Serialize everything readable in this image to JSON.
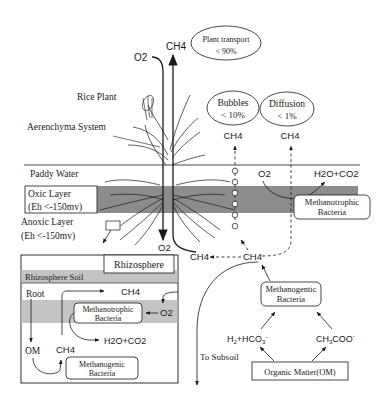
{
  "labels": {
    "o2_top": "O2",
    "ch4_top": "CH4",
    "plant_transport": "Plant transport",
    "plant_transport_pct": "< 90%",
    "rice_plant": "Rice Plant",
    "aerenchyma": "Aerenchyma System",
    "bubbles": "Bubbles",
    "bubbles_pct": "< 10%",
    "diffusion": "Diffusion",
    "diffusion_pct": "< 1%",
    "ch4_bubbles": "CH4",
    "ch4_diffusion": "CH4",
    "paddy_water": "Paddy Water",
    "oxic_layer": "Oxic Layer",
    "oxic_eh": "(Eh <-150mv)",
    "anoxic_layer": "Anoxic Layer",
    "anoxic_eh": "(Eh <-150mv)",
    "o2_water": "O2",
    "h2o_co2_top": "H2O+CO2",
    "methanotrophic_top_1": "Methanotrophic",
    "methanotrophic_top_2": "Bacteria",
    "o2_root": "O2",
    "ch4_root": "CH4",
    "ch4_center": "CH4",
    "methanogentic_1": "Methanogentic",
    "methanogentic_2": "Bacteria",
    "h2_hco3": "H2+HCO3-",
    "ch3coo": "CH3COO-",
    "to_subsoil": "To Subsoil",
    "organic_matter": "Organic Matter(OM)"
  },
  "inset": {
    "title": "Rhizosphere",
    "soil": "Rhizosphere Soil",
    "root": "Root",
    "ch4_top": "CH4",
    "methanotrophic_1": "Methanotrophic",
    "methanotrophic_2": "Bacteria",
    "o2": "O2",
    "h2o_co2": "H2O+CO2",
    "om": "OM",
    "ch4_bottom": "CH4",
    "methanogenic_1": "Methanogenic",
    "methanogenic_2": "Bacteria"
  },
  "colors": {
    "oxic_band": "#8c8c8c",
    "inset_band": "#c4c4c4",
    "line": "#1a1a1a"
  }
}
